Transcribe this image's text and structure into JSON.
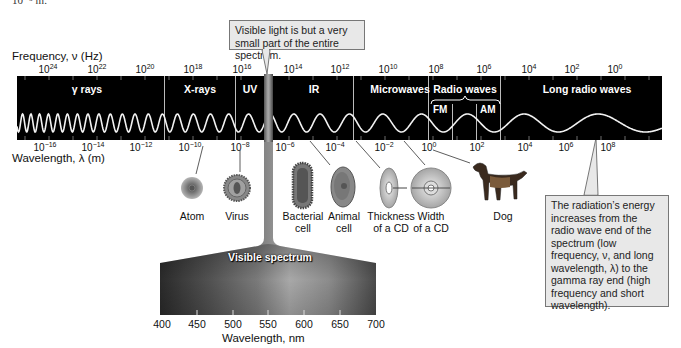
{
  "top_fragment": "10⁻⁵ m.",
  "frequency_axis": {
    "title": "Frequency, ν (Hz)",
    "ticks": [
      {
        "base": "10",
        "exp": "24",
        "x": 48
      },
      {
        "base": "10",
        "exp": "22",
        "x": 97
      },
      {
        "base": "10",
        "exp": "20",
        "x": 145
      },
      {
        "base": "10",
        "exp": "18",
        "x": 193
      },
      {
        "base": "10",
        "exp": "16",
        "x": 242
      },
      {
        "base": "10",
        "exp": "14",
        "x": 293
      },
      {
        "base": "10",
        "exp": "12",
        "x": 340
      },
      {
        "base": "10",
        "exp": "10",
        "x": 388
      },
      {
        "base": "10",
        "exp": "8",
        "x": 436
      },
      {
        "base": "10",
        "exp": "6",
        "x": 484
      },
      {
        "base": "10",
        "exp": "4",
        "x": 529
      },
      {
        "base": "10",
        "exp": "2",
        "x": 572
      },
      {
        "base": "10",
        "exp": "0",
        "x": 615
      }
    ]
  },
  "wavelength_axis": {
    "title": "Wavelength, λ (m)",
    "ticks": [
      {
        "base": "10",
        "exp": "−16",
        "x": 45
      },
      {
        "base": "10",
        "exp": "−14",
        "x": 93
      },
      {
        "base": "10",
        "exp": "−12",
        "x": 141
      },
      {
        "base": "10",
        "exp": "−10",
        "x": 190
      },
      {
        "base": "10",
        "exp": "−8",
        "x": 240
      },
      {
        "base": "10",
        "exp": "−6",
        "x": 285
      },
      {
        "base": "10",
        "exp": "−4",
        "x": 335
      },
      {
        "base": "10",
        "exp": "−2",
        "x": 384
      },
      {
        "base": "10",
        "exp": "0",
        "x": 429
      },
      {
        "base": "10",
        "exp": "2",
        "x": 477
      },
      {
        "base": "10",
        "exp": "4",
        "x": 525
      },
      {
        "base": "10",
        "exp": "6",
        "x": 566
      },
      {
        "base": "10",
        "exp": "8",
        "x": 608
      }
    ]
  },
  "bands": [
    {
      "label": "γ rays",
      "x": 87
    },
    {
      "label": "X-rays",
      "x": 200
    },
    {
      "label": "UV",
      "x": 250
    },
    {
      "label": "IR",
      "x": 314
    },
    {
      "label": "Microwaves",
      "x": 400
    },
    {
      "label": "Radio waves",
      "x": 465
    },
    {
      "label": "Long radio waves",
      "x": 587
    }
  ],
  "radio_subbands": [
    "FM",
    "AM"
  ],
  "callouts": {
    "visible": "Visible light is but a very small part of the entire spectrum.",
    "energy": "The radiation’s energy increases from the radio wave end of the spectrum (low frequency, ν, and long wavelength, λ) to the gamma ray end (high frequency and short wavelength)."
  },
  "objects": [
    {
      "name": "atom",
      "label1": "Atom",
      "label2": "",
      "x": 192
    },
    {
      "name": "virus",
      "label1": "Virus",
      "label2": "",
      "x": 237
    },
    {
      "name": "bacterial-cell",
      "label1": "Bacterial",
      "label2": "cell",
      "x": 303
    },
    {
      "name": "animal-cell",
      "label1": "Animal",
      "label2": "cell",
      "x": 344
    },
    {
      "name": "cd-thickness",
      "label1": "Thickness",
      "label2": "of a CD",
      "x": 391
    },
    {
      "name": "cd-width",
      "label1": "Width",
      "label2": "of a CD",
      "x": 431
    },
    {
      "name": "dog",
      "label1": "Dog",
      "label2": "",
      "x": 503
    }
  ],
  "visible_spectrum": {
    "label": "Visible spectrum",
    "xlabel": "Wavelength, nm",
    "ticks": [
      "400",
      "450",
      "500",
      "550",
      "600",
      "650",
      "700"
    ]
  }
}
